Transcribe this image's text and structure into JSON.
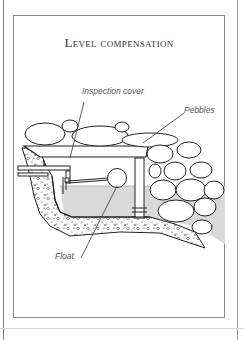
{
  "figure": {
    "title": "Level compensation",
    "labels": {
      "inspection_cover": "Inspection cover",
      "pebbles": "Pebbles",
      "float": "Float"
    },
    "colors": {
      "line": "#222222",
      "water": "#d9d9d9",
      "frame": "#8a8a8a",
      "label_text": "#555555"
    }
  }
}
